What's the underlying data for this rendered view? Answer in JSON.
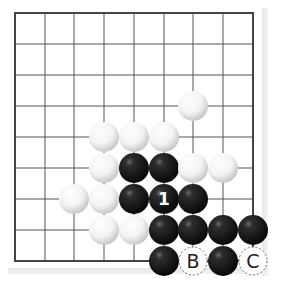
{
  "diagram": {
    "type": "go-board-partial",
    "grid": {
      "columns": 9,
      "rows": 9,
      "x": [
        15,
        45,
        74,
        104,
        134,
        164,
        193,
        223,
        253
      ],
      "y": [
        13,
        44,
        75,
        106,
        137,
        168,
        199,
        230,
        261
      ],
      "line_color": "#555555",
      "border_color": "#444444"
    },
    "stone_radius": 15,
    "colors": {
      "black_stone": "#1a1a1a",
      "white_stone": "#f2f2f2",
      "label_on_black": "#ffffff",
      "label_on_empty": "#222222"
    },
    "stones": [
      {
        "color": "white",
        "col": 6,
        "row": 3
      },
      {
        "color": "white",
        "col": 3,
        "row": 4
      },
      {
        "color": "white",
        "col": 4,
        "row": 4
      },
      {
        "color": "white",
        "col": 5,
        "row": 4
      },
      {
        "color": "white",
        "col": 3,
        "row": 5
      },
      {
        "color": "black",
        "col": 4,
        "row": 5
      },
      {
        "color": "black",
        "col": 5,
        "row": 5
      },
      {
        "color": "white",
        "col": 6,
        "row": 5
      },
      {
        "color": "white",
        "col": 7,
        "row": 5
      },
      {
        "color": "white",
        "col": 2,
        "row": 6
      },
      {
        "color": "white",
        "col": 3,
        "row": 6
      },
      {
        "color": "black",
        "col": 4,
        "row": 6
      },
      {
        "color": "black",
        "col": 5,
        "row": 6,
        "label": "1"
      },
      {
        "color": "black",
        "col": 6,
        "row": 6
      },
      {
        "color": "white",
        "col": 3,
        "row": 7
      },
      {
        "color": "white",
        "col": 4,
        "row": 7
      },
      {
        "color": "black",
        "col": 5,
        "row": 7
      },
      {
        "color": "black",
        "col": 6,
        "row": 7
      },
      {
        "color": "black",
        "col": 7,
        "row": 7
      },
      {
        "color": "black",
        "col": 8,
        "row": 7
      },
      {
        "color": "black",
        "col": 5,
        "row": 8
      },
      {
        "color": "black",
        "col": 7,
        "row": 8
      }
    ],
    "markers": [
      {
        "label": "B",
        "col": 6,
        "row": 8
      },
      {
        "label": "C",
        "col": 8,
        "row": 8
      }
    ]
  }
}
